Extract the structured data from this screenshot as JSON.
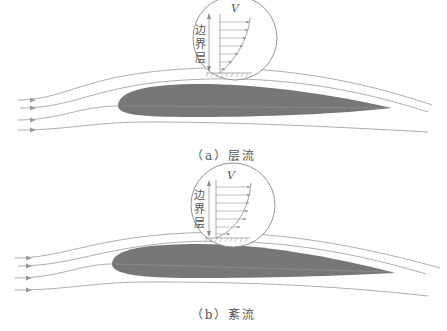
{
  "panels": [
    {
      "id": "a",
      "caption": "（a）层流",
      "velocity_label": "V",
      "boundary_layer_label": [
        "边",
        "界",
        "层"
      ],
      "flow_type": "laminar"
    },
    {
      "id": "b",
      "caption": "（b）紊流",
      "velocity_label": "V",
      "boundary_layer_label": [
        "边",
        "界",
        "层"
      ],
      "flow_type": "turbulent"
    }
  ],
  "colors": {
    "airfoil": "#777777",
    "streamline": "#9a9a9a",
    "profile_line": "#888888",
    "text": "#555555"
  }
}
